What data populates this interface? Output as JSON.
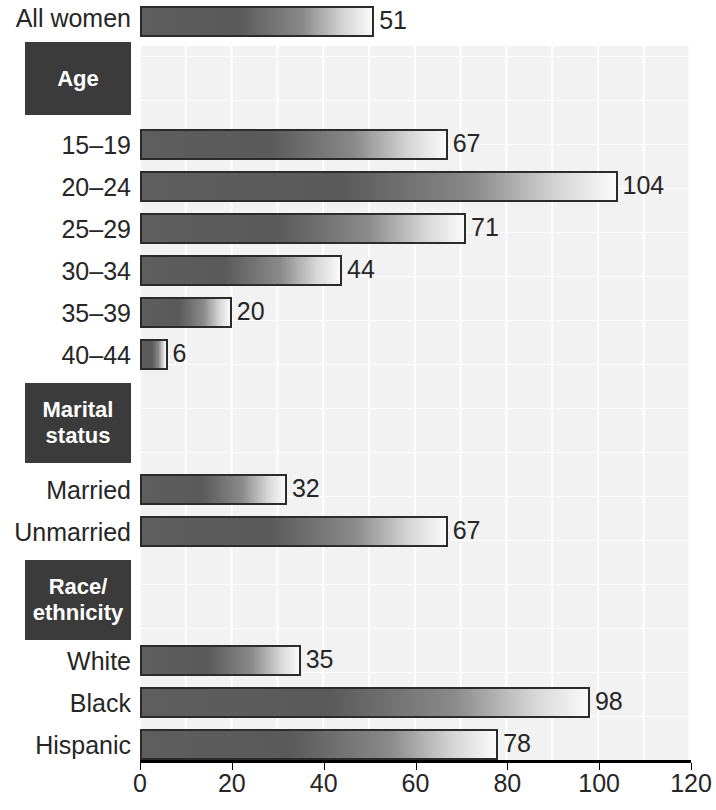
{
  "chart_data": {
    "type": "bar",
    "orientation": "horizontal",
    "title": "",
    "subtitle": "",
    "xlabel": "",
    "ylabel": "",
    "xlim": [
      0,
      120
    ],
    "xticks": [
      0,
      20,
      40,
      60,
      80,
      100,
      120
    ],
    "xtick_labels": [
      "0",
      "20",
      "40",
      "60",
      "80",
      "100",
      "120"
    ],
    "grid": true,
    "legend": null,
    "categories": [
      "All women",
      "15–19",
      "20–24",
      "25–29",
      "30–34",
      "35–39",
      "40–44",
      "Married",
      "Unmarried",
      "White",
      "Black",
      "Hispanic"
    ],
    "values": [
      51,
      67,
      104,
      71,
      44,
      20,
      6,
      32,
      67,
      35,
      98,
      78
    ],
    "value_labels": [
      "51",
      "67",
      "104",
      "71",
      "44",
      "20",
      "6",
      "32",
      "67",
      "35",
      "98",
      "78"
    ],
    "group_headers": [
      {
        "label": "Age",
        "lines": [
          "Age"
        ]
      },
      {
        "label": "Marital status",
        "lines": [
          "Marital",
          "status"
        ]
      },
      {
        "label": "Race/ethnicity",
        "lines": [
          "Race/",
          "ethnicity"
        ]
      }
    ],
    "colors": {
      "bar_dark": "#5a5a5a",
      "bar_light": "#fafafa",
      "bar_border": "#2b2b2b",
      "group_box_bg": "#3b3b3b",
      "group_box_text": "#ffffff",
      "plot_bg": "#f2f2f2",
      "axis": "#000000",
      "text": "#262626"
    }
  },
  "rows": [
    {
      "label": "All women",
      "value": 51,
      "value_label": "51"
    },
    {
      "label": "15–19",
      "value": 67,
      "value_label": "67"
    },
    {
      "label": "20–24",
      "value": 104,
      "value_label": "104"
    },
    {
      "label": "25–29",
      "value": 71,
      "value_label": "71"
    },
    {
      "label": "30–34",
      "value": 44,
      "value_label": "44"
    },
    {
      "label": "35–39",
      "value": 20,
      "value_label": "20"
    },
    {
      "label": "40–44",
      "value": 6,
      "value_label": "6"
    },
    {
      "label": "Married",
      "value": 32,
      "value_label": "32"
    },
    {
      "label": "Unmarried",
      "value": 67,
      "value_label": "67"
    },
    {
      "label": "White",
      "value": 35,
      "value_label": "35"
    },
    {
      "label": "Black",
      "value": 98,
      "value_label": "98"
    },
    {
      "label": "Hispanic",
      "value": 78,
      "value_label": "78"
    }
  ],
  "groups": [
    {
      "line1": "Age",
      "line2": ""
    },
    {
      "line1": "Marital",
      "line2": "status"
    },
    {
      "line1": "Race/",
      "line2": "ethnicity"
    }
  ],
  "axis": {
    "ticks": [
      "0",
      "20",
      "40",
      "60",
      "80",
      "100",
      "120"
    ]
  }
}
